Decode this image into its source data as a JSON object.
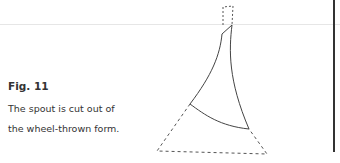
{
  "figure": {
    "label": "Fig. 11",
    "caption_lines": [
      "The spout is cut out of",
      "the wheel-thrown form."
    ]
  },
  "colors": {
    "text": "#333333",
    "line": "#444444",
    "rule": "#e6e6e6"
  }
}
